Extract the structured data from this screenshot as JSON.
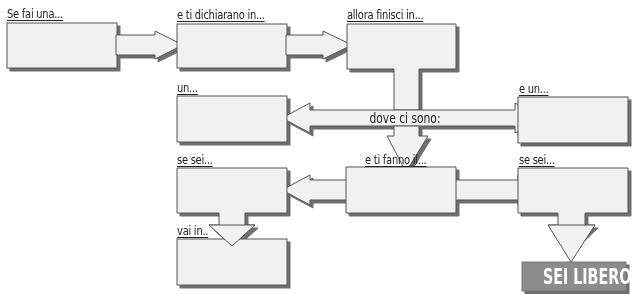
{
  "diagram": {
    "type": "flowchart",
    "colors": {
      "box_fill": "#f1f1f1",
      "box_stroke": "#555555",
      "shadow": "#6e6e6e",
      "result_fill": "#8c8c8c",
      "result_text": "#ffffff"
    },
    "nodes": [
      {
        "id": "n1",
        "label": "Se fai una..."
      },
      {
        "id": "n2",
        "label": "e ti dichiarano in..."
      },
      {
        "id": "n3",
        "label": "allora finisci in..."
      },
      {
        "id": "n4",
        "label": "un..."
      },
      {
        "id": "n5",
        "label": "e un..."
      },
      {
        "id": "n6",
        "label": "se sei..."
      },
      {
        "id": "n7",
        "label": "e ti fanno il..."
      },
      {
        "id": "n8",
        "label": "se sei..."
      },
      {
        "id": "n9",
        "label": "vai in.."
      },
      {
        "id": "n10",
        "label": "SEI LIBERO!!!"
      }
    ],
    "connector_label": "dove ci sono:",
    "edges": [
      {
        "from": "n1",
        "to": "n2"
      },
      {
        "from": "n2",
        "to": "n3"
      },
      {
        "from": "n3",
        "to": "n7",
        "via": "dove ci sono:"
      },
      {
        "from": "dove ci sono:",
        "to": "n4"
      },
      {
        "from": "dove ci sono:",
        "to": "n5"
      },
      {
        "from": "n7",
        "to": "n6"
      },
      {
        "from": "n7",
        "to": "n8"
      },
      {
        "from": "n6",
        "to": "n9"
      },
      {
        "from": "n8",
        "to": "n10"
      }
    ]
  }
}
